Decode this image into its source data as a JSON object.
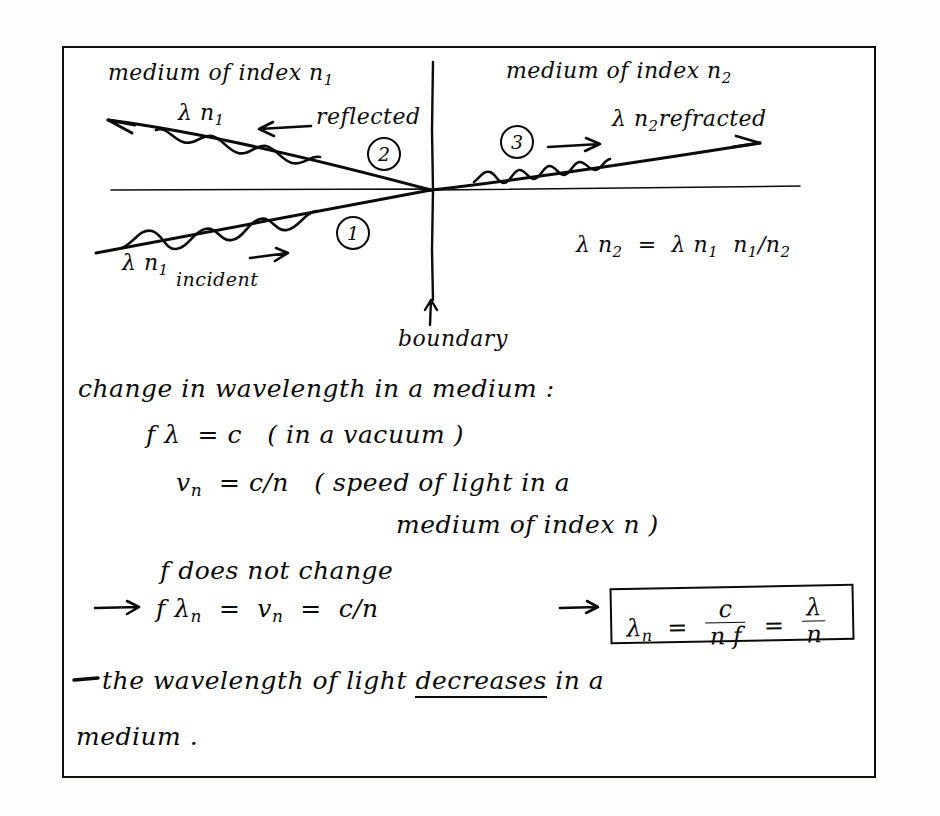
{
  "document": {
    "kind": "handwritten-physics-note",
    "topic": "Refraction and change of wavelength at a boundary",
    "ink_color": "#0b0b0b",
    "paper_color": "#ffffff",
    "frame_color": "#111111"
  },
  "diagram": {
    "label_medium_left": "medium of index n",
    "label_medium_left_sub": "1",
    "label_medium_right": "medium of index n",
    "label_medium_right_sub": "2",
    "reflected_lambda": "λ n",
    "reflected_lambda_sub": "1",
    "reflected_word": "reflected",
    "reflected_arrow": "←",
    "refracted_lambda": "λ n",
    "refracted_lambda_sub": "2",
    "refracted_word": "refracted",
    "refracted_arrow": "→",
    "incident_lambda": "λ n",
    "incident_lambda_sub": "1",
    "incident_word": "incident",
    "incident_arrow": "→",
    "ray_number_incident": "1",
    "ray_number_reflected": "2",
    "ray_number_refracted": "3",
    "boundary_arrow": "↑",
    "boundary_label": "boundary",
    "side_equation": {
      "lhs": "λ n",
      "lhs_sub": "2",
      "eq": "=",
      "rhs_lambda": "λ n",
      "rhs_lambda_sub": "1",
      "rhs_ratio_num": "n",
      "rhs_ratio_num_sub": "1",
      "rhs_slash": "/",
      "rhs_ratio_den": "n",
      "rhs_ratio_den_sub": "2"
    }
  },
  "notes": {
    "heading": "change in wavelength in a medium :",
    "line_flc": {
      "f": "f",
      "lambda": "λ",
      "equals": "=",
      "c": "c",
      "paren": "( in a vacuum )"
    },
    "line_vn": {
      "v": "v",
      "v_sub": "n",
      "equals": "=",
      "rhs": "c/n",
      "paren_open": "( speed of light in a"
    },
    "line_vn_cont": "medium of index n )",
    "line_f_const": "f does not change",
    "line_implies": {
      "arrow": "→",
      "f": "f",
      "lambda": "λ",
      "lambda_sub": "n",
      "eq1": "=",
      "v": "v",
      "v_sub": "n",
      "eq2": "=",
      "rhs": "c/n",
      "arrow2": "→"
    },
    "boxed_result": {
      "lambda": "λ",
      "lambda_sub": "n",
      "equals": "=",
      "frac1_num": "c",
      "frac1_den": "n f",
      "equals2": "=",
      "frac2_num": "λ",
      "frac2_den": "n"
    },
    "conclusion_part1": "the  wavelength  of  light ",
    "conclusion_emphasis": "decreases",
    "conclusion_part2": " in  a",
    "conclusion_line2": "medium ."
  }
}
